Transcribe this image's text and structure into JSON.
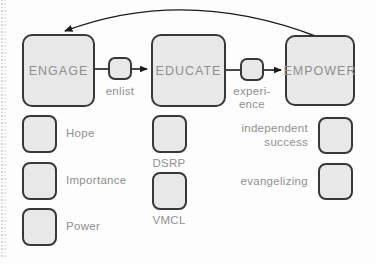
{
  "diagram": {
    "stages": [
      {
        "id": "engage",
        "label": "ENGAGE"
      },
      {
        "id": "educate",
        "label": "EDUCATE"
      },
      {
        "id": "empower",
        "label": "EMPOWER"
      }
    ],
    "connectors": [
      {
        "from": "engage",
        "to": "educate",
        "label": "enlist"
      },
      {
        "from": "educate",
        "to": "empower",
        "label": "experi-\nence"
      }
    ],
    "feedback_arc": {
      "from": "empower",
      "to": "engage"
    },
    "engage_items": [
      {
        "label": "Hope"
      },
      {
        "label": "Importance"
      },
      {
        "label": "Power"
      }
    ],
    "educate_items": [
      {
        "label": "DSRP"
      },
      {
        "label": "VMCL"
      }
    ],
    "empower_items": [
      {
        "label": "independent\nsuccess"
      },
      {
        "label": "evangelizing"
      }
    ],
    "colors": {
      "background": "#fdfdfd",
      "box_fill": "#e8e8e8",
      "box_border": "#383838",
      "label_text": "#8f8f8f",
      "arrow": "#1c1c1c"
    }
  }
}
